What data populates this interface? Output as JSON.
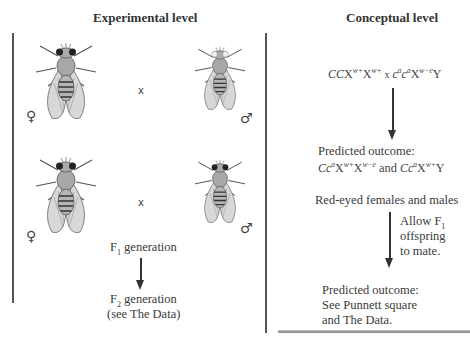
{
  "experimental": {
    "title": "Experimental level",
    "cross1": {
      "female_symbol": "♀",
      "male_symbol": "♂",
      "cross_symbol": "x",
      "female_eyes": "red",
      "male_eyes": "white"
    },
    "cross2": {
      "female_symbol": "♀",
      "male_symbol": "♂",
      "cross_symbol": "x",
      "female_eyes": "red",
      "male_eyes": "red"
    },
    "f1_label": "F",
    "f1_sub": "1",
    "f1_rest": " generation",
    "f2_label": "F",
    "f2_sub": "2",
    "f2_rest": " generation",
    "f2_note": "(see The Data)"
  },
  "conceptual": {
    "title": "Conceptual level",
    "parental_cross": "CCXw+Xw+ x cacaXw−eY",
    "predicted1_heading": "Predicted outcome:",
    "predicted1_genotypes": "CcaXw+Xw−e and CcaXw+Y",
    "phenotype": "Red-eyed females and males",
    "allow_line1": "Allow F",
    "allow_sub": "1",
    "allow_line2": "offspring",
    "allow_line3": "to mate.",
    "predicted2_heading": "Predicted outcome:",
    "predicted2_line2": "See Punnett square",
    "predicted2_line3": "and The Data."
  },
  "colors": {
    "line": "#555555",
    "text": "#3a3a3a",
    "fly_body": "#9a9a9a",
    "fly_eye_red": "#222222",
    "fly_eye_white": "#e8e8e8"
  }
}
